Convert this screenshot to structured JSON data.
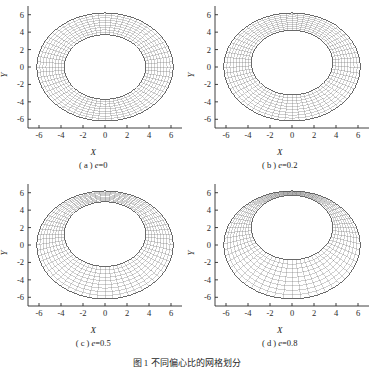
{
  "figure": {
    "caption": "图 1  不同偏心比的网格划分",
    "background": "#ffffff",
    "mesh_color": "#6e6e6e",
    "boundary_color": "#3a3a3a",
    "axis_color": "#2b2b2b"
  },
  "axes": {
    "x_label": "X",
    "y_label": "Y",
    "x_ticks": [
      "-6",
      "-4",
      "-2",
      "0",
      "2",
      "4",
      "6"
    ],
    "y_ticks": [
      "6",
      "4",
      "2",
      "0",
      "-2",
      "-4",
      "-6"
    ],
    "x_tick_values": [
      -6,
      -4,
      -2,
      0,
      2,
      4,
      6
    ],
    "y_tick_values": [
      6,
      4,
      2,
      0,
      -2,
      -4,
      -6
    ],
    "xlim": [
      -7,
      7
    ],
    "ylim": [
      -7,
      7
    ]
  },
  "panels": [
    {
      "id": "a",
      "label": "( a ) ",
      "var": "e",
      "eq": "=0",
      "caption": "( a ) e=0",
      "eccentricity": 0
    },
    {
      "id": "b",
      "label": "( b ) ",
      "var": "e",
      "eq": "=0.2",
      "caption": "( b ) e=0.2",
      "eccentricity": 0.2
    },
    {
      "id": "c",
      "label": "( c ) ",
      "var": "e",
      "eq": "=0.5",
      "caption": "( c ) e=0.5",
      "eccentricity": 0.5
    },
    {
      "id": "d",
      "label": "( d ) ",
      "var": "e",
      "eq": "=0.8",
      "caption": "( d ) e=0.8",
      "eccentricity": 0.8
    }
  ],
  "chart_data": {
    "type": "line",
    "title": "图 1  不同偏心比的网格划分",
    "xlabel": "X",
    "ylabel": "Y",
    "xlim": [
      -7,
      7
    ],
    "ylim": [
      -7,
      7
    ],
    "grid": false,
    "legend": "none",
    "geometry": {
      "outer_radius": 6.2,
      "inner_radius": 3.7,
      "clearance": 2.5,
      "radial_divisions": 9,
      "circumferential_divisions": 64,
      "inner_center_x": 0,
      "outer_center_x": 0,
      "outer_center_y": 0
    },
    "series": [
      {
        "name": "(a) e=0",
        "eccentricity": 0,
        "inner_center_y": 0.0,
        "min_gap": 2.5,
        "max_gap": 2.5
      },
      {
        "name": "(b) e=0.2",
        "eccentricity": 0.2,
        "inner_center_y": 0.5,
        "min_gap": 2.0,
        "max_gap": 3.0
      },
      {
        "name": "(c) e=0.5",
        "eccentricity": 0.5,
        "inner_center_y": 1.25,
        "min_gap": 1.25,
        "max_gap": 3.75
      },
      {
        "name": "(d) e=0.8",
        "eccentricity": 0.8,
        "inner_center_y": 2.0,
        "min_gap": 0.5,
        "max_gap": 4.5
      }
    ]
  }
}
